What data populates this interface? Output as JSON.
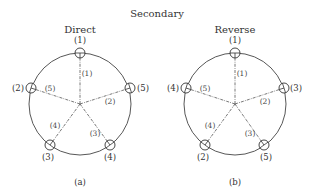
{
  "figure": {
    "title": "Secondary",
    "panels": [
      {
        "id": "a",
        "heading": "Direct",
        "caption": "(a)",
        "center": [
          80,
          104
        ],
        "radius": 51,
        "nodes": [
          {
            "pos": [
              80,
              53
            ],
            "outer_label": "(1)",
            "outer_at": [
              80,
              43
            ],
            "inner_label": "(1)",
            "inner_at": [
              87,
              76
            ]
          },
          {
            "pos": [
              130,
              88
            ],
            "outer_label": "(5)",
            "outer_at": [
              143,
              91
            ],
            "inner_label": "(2)",
            "inner_at": [
              110,
              104
            ]
          },
          {
            "pos": [
              110,
              145
            ],
            "outer_label": "(4)",
            "outer_at": [
              110,
              160
            ],
            "inner_label": "(3)",
            "inner_at": [
              95,
              136
            ]
          },
          {
            "pos": [
              50,
              145
            ],
            "outer_label": "(3)",
            "outer_at": [
              48,
              160
            ],
            "inner_label": "(4)",
            "inner_at": [
              55,
              128
            ]
          },
          {
            "pos": [
              31,
              88
            ],
            "outer_label": "(2)",
            "outer_at": [
              18,
              91
            ],
            "inner_label": "(5)",
            "inner_at": [
              50,
              91
            ]
          }
        ]
      },
      {
        "id": "b",
        "heading": "Reverse",
        "caption": "(b)",
        "center": [
          235,
          104
        ],
        "radius": 51,
        "nodes": [
          {
            "pos": [
              235,
              53
            ],
            "outer_label": "(1)",
            "outer_at": [
              235,
              43
            ],
            "inner_label": "(1)",
            "inner_at": [
              242,
              76
            ]
          },
          {
            "pos": [
              284,
              88
            ],
            "outer_label": "(3)",
            "outer_at": [
              296,
              91
            ],
            "inner_label": "(2)",
            "inner_at": [
              265,
              104
            ]
          },
          {
            "pos": [
              264,
              145
            ],
            "outer_label": "(5)",
            "outer_at": [
              266,
              160
            ],
            "inner_label": "(3)",
            "inner_at": [
              250,
              136
            ]
          },
          {
            "pos": [
              205,
              145
            ],
            "outer_label": "(2)",
            "outer_at": [
              203,
              160
            ],
            "inner_label": "(4)",
            "inner_at": [
              210,
              128
            ]
          },
          {
            "pos": [
              186,
              88
            ],
            "outer_label": "(4)",
            "outer_at": [
              173,
              91
            ],
            "inner_label": "(5)",
            "inner_at": [
              205,
              91
            ]
          }
        ]
      }
    ]
  }
}
